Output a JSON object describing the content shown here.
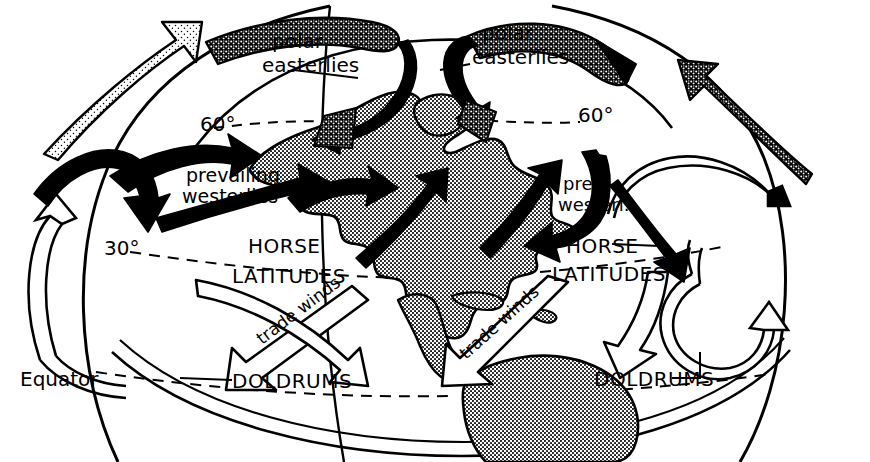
{
  "figure": {
    "background_color": "#ffffff",
    "ink_color": "#000000",
    "landmass_fill": "#b4b4b4"
  },
  "labels": {
    "polar_easterlies_left_line1": "polar",
    "polar_easterlies_left_line2": "easterlies",
    "polar_easterlies_right_line1": "polar",
    "polar_easterlies_right_line2": "easterlies",
    "lat60_left": "60°",
    "lat60_right": "60°",
    "lat30_left": "30°",
    "prevailing_westerlies_line1": "prevailing",
    "prevailing_westerlies_line2": "westerlies",
    "prev_westerl_line1": "prev.",
    "prev_westerl_line2": "westerl.",
    "horse_left": "HORSE",
    "latitudes_left": "LATITUDES",
    "horse_right": "HORSE",
    "latitudes_right": "LATITUDES",
    "trade_winds_left": "trade winds",
    "trade_winds_right": "trade winds",
    "doldrums_left": "DOLDRUMS",
    "doldrums_right": "DOLDRUMS",
    "equator": "Equator"
  },
  "wind_belts": [
    {
      "name": "polar-easterlies",
      "hemisphere": "north",
      "latitude_band": "60-90",
      "arrow_style": "stippled",
      "direction": "from-east"
    },
    {
      "name": "prevailing-westerlies",
      "hemisphere": "north",
      "latitude_band": "30-60",
      "arrow_style": "solid-black",
      "direction": "from-west"
    },
    {
      "name": "horse-latitudes",
      "hemisphere": "north",
      "latitude_band": "30",
      "arrow_style": "none",
      "direction": "descending"
    },
    {
      "name": "trade-winds",
      "hemisphere": "north",
      "latitude_band": "0-30",
      "arrow_style": "outline",
      "direction": "from-northeast"
    },
    {
      "name": "doldrums",
      "hemisphere": "equatorial",
      "latitude_band": "0",
      "arrow_style": "none",
      "direction": "rising"
    }
  ],
  "latitude_lines": [
    {
      "label": "60°",
      "value": 60
    },
    {
      "label": "30°",
      "value": 30
    },
    {
      "label": "Equator",
      "value": 0
    }
  ],
  "landmasses": [
    {
      "name": "north-america",
      "fill": "halftone"
    },
    {
      "name": "south-america",
      "fill": "halftone"
    },
    {
      "name": "greenland",
      "fill": "halftone"
    },
    {
      "name": "caribbean-islands",
      "fill": "halftone"
    }
  ]
}
